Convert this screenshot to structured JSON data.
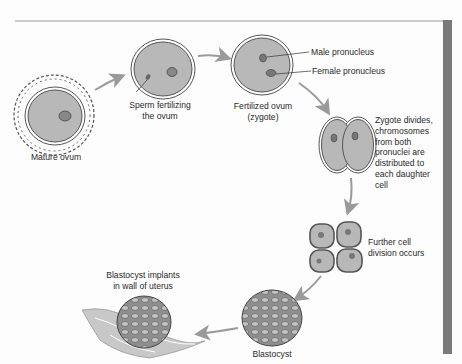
{
  "diagram": {
    "stages": [
      {
        "id": "mature-ovum",
        "label": "Mature ovum"
      },
      {
        "id": "sperm-fertilizing",
        "label_line1": "Sperm fertilizing",
        "label_line2": "the ovum"
      },
      {
        "id": "fertilized-ovum",
        "label_line1": "Fertilized ovum",
        "label_line2": "(zygote)"
      },
      {
        "id": "zygote-divides",
        "lines": [
          "Zygote divides,",
          "chromosomes",
          "from both",
          "pronuclei are",
          "distributed to",
          "each daughter",
          "cell"
        ]
      },
      {
        "id": "further-division",
        "label_line1": "Further cell",
        "label_line2": "division occurs"
      },
      {
        "id": "blastocyst",
        "label": "Blastocyst"
      },
      {
        "id": "implantation",
        "label_line1": "Blastocyst implants",
        "label_line2": "in wall of uterus"
      }
    ],
    "callouts": {
      "male": "Male pronucleus",
      "female": "Female pronucleus"
    },
    "colors": {
      "cell_fill": "#b8b8b8",
      "membrane": "#555555",
      "arrow": "#9a9a9a",
      "side_bar": "#7a7a7a",
      "rule": "#9a9a9a"
    }
  }
}
